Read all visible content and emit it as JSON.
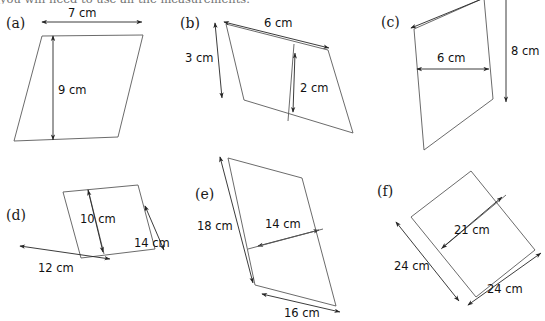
{
  "instruction": "you will need to use all the measurements.",
  "units": "cm",
  "stroke_colors": {
    "shape_outline": "#5a5a5a",
    "dimension_arrow": "#262626",
    "text": "#111111",
    "background": "#ffffff"
  },
  "figures": [
    {
      "key": "a",
      "label": "(a)",
      "shape": "parallelogram",
      "dimensions": [
        {
          "name": "base",
          "value": 7,
          "unit": "cm",
          "text": "7 cm"
        },
        {
          "name": "height",
          "value": 9,
          "unit": "cm",
          "text": "9 cm"
        }
      ]
    },
    {
      "key": "b",
      "label": "(b)",
      "shape": "parallelogram",
      "dimensions": [
        {
          "name": "side",
          "value": 3,
          "unit": "cm",
          "text": "3 cm"
        },
        {
          "name": "base",
          "value": 6,
          "unit": "cm",
          "text": "6 cm"
        },
        {
          "name": "height",
          "value": 2,
          "unit": "cm",
          "text": "2 cm"
        }
      ]
    },
    {
      "key": "c",
      "label": "(c)",
      "shape": "parallelogram",
      "dimensions": [
        {
          "name": "base",
          "value": 6,
          "unit": "cm",
          "text": "6 cm"
        },
        {
          "name": "height",
          "value": 8,
          "unit": "cm",
          "text": "8 cm"
        }
      ]
    },
    {
      "key": "d",
      "label": "(d)",
      "shape": "parallelogram",
      "dimensions": [
        {
          "name": "height",
          "value": 10,
          "unit": "cm",
          "text": "10 cm"
        },
        {
          "name": "side",
          "value": 14,
          "unit": "cm",
          "text": "14 cm"
        },
        {
          "name": "base",
          "value": 12,
          "unit": "cm",
          "text": "12 cm"
        }
      ]
    },
    {
      "key": "e",
      "label": "(e)",
      "shape": "parallelogram",
      "dimensions": [
        {
          "name": "side",
          "value": 18,
          "unit": "cm",
          "text": "18 cm"
        },
        {
          "name": "height",
          "value": 14,
          "unit": "cm",
          "text": "14 cm"
        },
        {
          "name": "base",
          "value": 16,
          "unit": "cm",
          "text": "16 cm"
        }
      ]
    },
    {
      "key": "f",
      "label": "(f)",
      "shape": "parallelogram",
      "dimensions": [
        {
          "name": "height",
          "value": 21,
          "unit": "cm",
          "text": "21 cm"
        },
        {
          "name": "side",
          "value": 24,
          "unit": "cm",
          "text": "24 cm"
        },
        {
          "name": "base",
          "value": 24,
          "unit": "cm",
          "text": "24 cm"
        }
      ]
    }
  ]
}
